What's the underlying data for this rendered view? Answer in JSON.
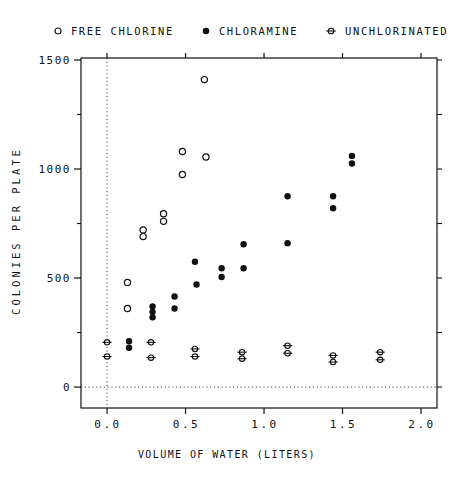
{
  "figure": {
    "background": "#ffffff",
    "ink": "#111111"
  },
  "legend": {
    "items": [
      {
        "label": "FREE CHLORINE",
        "marker": "open-circle"
      },
      {
        "label": "CHLORAMINE",
        "marker": "filled-circle"
      },
      {
        "label": "UNCHLORINATED",
        "marker": "circle-hline"
      }
    ]
  },
  "chart_data": {
    "type": "scatter",
    "title": "",
    "xlabel": "VOLUME OF WATER (LITERS)",
    "ylabel": "COLONIES PER PLATE",
    "xlim": [
      -0.166,
      2.102
    ],
    "ylim": [
      -96,
      1509
    ],
    "grid": false,
    "legend_position": "top",
    "reference_lines": {
      "x": 0,
      "y": 0,
      "style": "dotted"
    },
    "xticks": {
      "values": [
        0,
        0.5,
        1.0,
        1.5,
        2.0
      ],
      "labels": [
        "0.0",
        "0.5",
        "1.0",
        "1.5",
        "2.0"
      ]
    },
    "yticks": {
      "values": [
        0,
        500,
        1000,
        1500
      ],
      "labels": [
        "0",
        "500",
        "1000",
        "1500"
      ],
      "minor": [
        250,
        750,
        1250
      ]
    },
    "series": [
      {
        "name": "FREE CHLORINE",
        "marker": "open-circle",
        "points": [
          [
            0.13,
            480
          ],
          [
            0.13,
            360
          ],
          [
            0.23,
            720
          ],
          [
            0.23,
            690
          ],
          [
            0.36,
            795
          ],
          [
            0.36,
            760
          ],
          [
            0.48,
            1080
          ],
          [
            0.48,
            975
          ],
          [
            0.62,
            1410
          ],
          [
            0.63,
            1055
          ]
        ]
      },
      {
        "name": "CHLORAMINE",
        "marker": "filled-circle",
        "points": [
          [
            0.14,
            210
          ],
          [
            0.14,
            180
          ],
          [
            0.29,
            370
          ],
          [
            0.29,
            345
          ],
          [
            0.29,
            320
          ],
          [
            0.43,
            415
          ],
          [
            0.43,
            360
          ],
          [
            0.56,
            575
          ],
          [
            0.57,
            470
          ],
          [
            0.73,
            545
          ],
          [
            0.73,
            505
          ],
          [
            0.87,
            655
          ],
          [
            0.87,
            545
          ],
          [
            1.15,
            875
          ],
          [
            1.15,
            660
          ],
          [
            1.44,
            875
          ],
          [
            1.44,
            820
          ],
          [
            1.56,
            1060
          ],
          [
            1.56,
            1025
          ]
        ]
      },
      {
        "name": "UNCHLORINATED",
        "marker": "circle-hline",
        "points": [
          [
            0.0,
            205
          ],
          [
            0.0,
            140
          ],
          [
            0.28,
            205
          ],
          [
            0.28,
            135
          ],
          [
            0.56,
            175
          ],
          [
            0.56,
            140
          ],
          [
            0.86,
            160
          ],
          [
            0.86,
            130
          ],
          [
            1.15,
            190
          ],
          [
            1.15,
            155
          ],
          [
            1.44,
            145
          ],
          [
            1.44,
            115
          ],
          [
            1.74,
            160
          ],
          [
            1.74,
            125
          ]
        ]
      }
    ]
  }
}
